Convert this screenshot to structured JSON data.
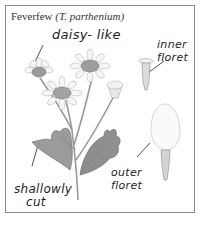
{
  "title": {
    "common_name": "Feverfew",
    "latin_name": "(T. parthenium)"
  },
  "labels": {
    "daisy_like": "daisy- like",
    "inner_floret_line1": "inner",
    "inner_floret_line2": "floret",
    "outer_floret_line1": "outer",
    "outer_floret_line2": "floret",
    "shallowly_cut_line1": "shallowly",
    "shallowly_cut_line2": "cut"
  },
  "colors": {
    "border": "#8a8a8a",
    "ink": "#1e1e1e",
    "petal": "#f4f4f0",
    "leaf": "#8c8c8c",
    "stem": "#9a9a9a"
  }
}
